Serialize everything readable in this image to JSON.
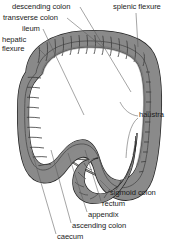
{
  "figure": {
    "width": 175,
    "height": 247,
    "background_color": "#ffffff"
  },
  "palette": {
    "text": "#1b1b1b",
    "leader_line": "#5a5a5a",
    "colon_wall": "#8a8a8a",
    "colon_wall_dark": "#6d6d6d",
    "colon_outline": "#2b2b2b",
    "small_intestine": "#d8d8d5",
    "small_intestine_shadow": "#bdbdba",
    "small_intestine_outline": "#3a3a3a",
    "background": "#ffffff"
  },
  "labels": [
    {
      "id": "descending-colon",
      "text": "descending colon"
    },
    {
      "id": "transverse-colon",
      "text": "transverse colon"
    },
    {
      "id": "ileum",
      "text": "ileum"
    },
    {
      "id": "hepatic-flexure",
      "text": "hepatic flexure"
    },
    {
      "id": "splenic-flexure",
      "text": "splenic flexure"
    },
    {
      "id": "haustra",
      "text": "haustra"
    },
    {
      "id": "sigmoid-colon",
      "text": "sigmoid colon"
    },
    {
      "id": "rectum",
      "text": "rectum"
    },
    {
      "id": "appendix",
      "text": "appendix"
    },
    {
      "id": "ascending-colon",
      "text": "ascending colon"
    },
    {
      "id": "caecum",
      "text": "caecum"
    }
  ],
  "label_text": {
    "descending_colon": "descending colon",
    "transverse_colon": "transverse colon",
    "ileum": "ileum",
    "hepatic_flexure": "hepatic flexure",
    "splenic_flexure": "splenic flexure",
    "haustra": "haustra",
    "sigmoid_colon": "sigmoid colon",
    "rectum": "rectum",
    "appendix": "appendix",
    "ascending_colon": "ascending colon",
    "caecum": "caecum"
  }
}
